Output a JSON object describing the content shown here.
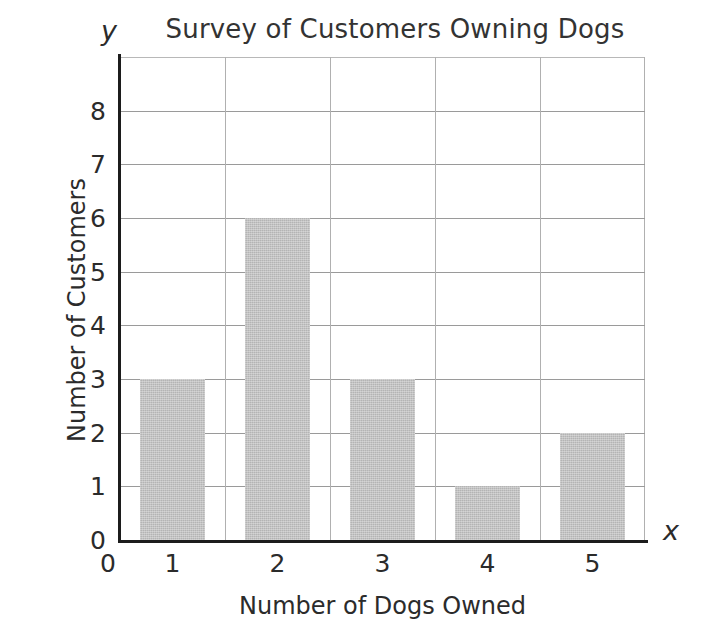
{
  "chart_data": {
    "type": "bar",
    "title": "Survey of Customers Owning Dogs",
    "xlabel": "Number of Dogs Owned",
    "ylabel": "Number of Customers",
    "x_axis_letter": "y",
    "y_axis_letter": "x",
    "categories": [
      "1",
      "2",
      "3",
      "4",
      "5"
    ],
    "values": [
      3,
      6,
      3,
      1,
      2
    ],
    "xlim": [
      0,
      5.5
    ],
    "ylim": [
      0,
      9
    ],
    "x_tick_labels": [
      "0",
      "1",
      "2",
      "3",
      "4",
      "5"
    ],
    "y_tick_labels": [
      "0",
      "1",
      "2",
      "3",
      "4",
      "5",
      "6",
      "7",
      "8"
    ],
    "y_gridline_values": [
      1,
      2,
      3,
      4,
      5,
      6,
      7,
      8
    ],
    "grid": true,
    "legend": false,
    "bar_color": "#b4b4b4",
    "axis_color": "#1c1c1c",
    "grid_color": "#9a9a9a",
    "text_color": "#2b2b2b"
  },
  "axis_letters": {
    "y": "y",
    "x": "x"
  }
}
